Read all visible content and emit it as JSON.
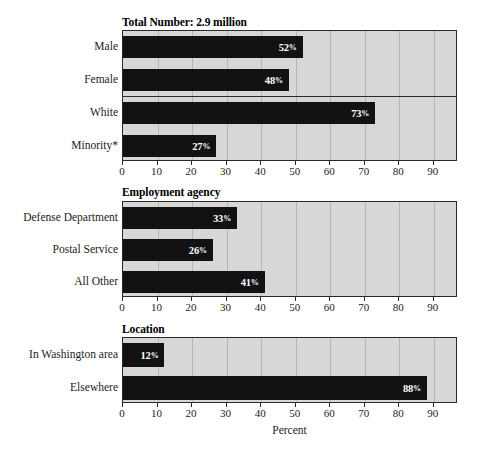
{
  "chart_data": {
    "type": "bar",
    "orientation": "horizontal",
    "title": "",
    "xlabel": "Percent",
    "ylabel": "",
    "xlim": [
      0,
      97
    ],
    "grid": true,
    "legend": "none",
    "xticks": [
      0,
      10,
      20,
      30,
      40,
      50,
      60,
      70,
      80,
      90
    ],
    "xticklabels": [
      "0",
      "10",
      "20",
      "30",
      "40",
      "50",
      "60",
      "70",
      "80",
      "90"
    ],
    "panels": [
      {
        "title": "Total Number: 2.9 million",
        "categories": [
          "Male",
          "Female",
          "White",
          "Minority*"
        ],
        "values": [
          52,
          48,
          73,
          27
        ],
        "labels": [
          "52%",
          "48%",
          "73%",
          "27%"
        ],
        "separator_after_index": 1
      },
      {
        "title": "Employment agency",
        "categories": [
          "Defense Department",
          "Postal Service",
          "All Other"
        ],
        "values": [
          33,
          26,
          41
        ],
        "labels": [
          "33%",
          "26%",
          "41%"
        ],
        "separator_after_index": -1
      },
      {
        "title": "Location",
        "categories": [
          "In Washington area",
          "Elsewhere"
        ],
        "values": [
          12,
          88
        ],
        "labels": [
          "12%",
          "88%"
        ],
        "separator_after_index": -1
      }
    ],
    "colors": {
      "bar": "#121212",
      "plot_background": "#d7d7d7",
      "gridline": "#b4b4b4",
      "axis": "#2a2a2a",
      "value_label": "#ffffff"
    }
  }
}
